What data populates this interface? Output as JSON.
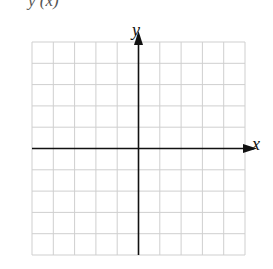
{
  "header": {
    "partial_text": "y (x)"
  },
  "axes": {
    "x_label": "x",
    "y_label": "y"
  },
  "grid": {
    "columns": 10,
    "rows": 10,
    "left": 32,
    "top": 42,
    "cell": 21.3,
    "line_color": "#cfcfcf",
    "axis_color": "#111111"
  }
}
